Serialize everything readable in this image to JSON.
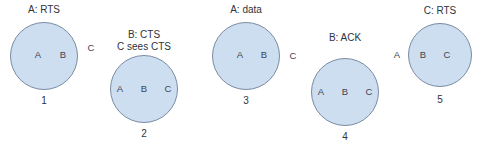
{
  "figure": {
    "background_color": "#ffffff",
    "circle_fill_color": "#cddef0",
    "circle_border_color": "#7a8ba3",
    "text_color": "#2f333c"
  },
  "panels": [
    {
      "id": "panel-1",
      "number": "1",
      "event_lines": [
        "A: RTS"
      ],
      "circle": {
        "cx": 44,
        "cy": 56,
        "r": 34
      },
      "inside_nodes": [
        {
          "label": "A",
          "x": 38,
          "y": 55
        },
        {
          "label": "B",
          "x": 63,
          "y": 55
        }
      ],
      "outside_nodes": [
        {
          "label": "C",
          "x": 91,
          "y": 48
        }
      ],
      "event_x": 44,
      "event_y": 4,
      "number_x": 44,
      "number_y": 95
    },
    {
      "id": "panel-2",
      "number": "2",
      "event_lines": [
        "B: CTS",
        "C sees CTS"
      ],
      "circle": {
        "cx": 144,
        "cy": 89,
        "r": 34
      },
      "inside_nodes": [
        {
          "label": "A",
          "x": 120,
          "y": 89
        },
        {
          "label": "B",
          "x": 144,
          "y": 89
        },
        {
          "label": "C",
          "x": 168,
          "y": 89
        }
      ],
      "outside_nodes": [],
      "event_x": 144,
      "event_y": 29,
      "number_x": 144,
      "number_y": 128
    },
    {
      "id": "panel-3",
      "number": "3",
      "event_lines": [
        "A: data"
      ],
      "circle": {
        "cx": 246,
        "cy": 56,
        "r": 34
      },
      "inside_nodes": [
        {
          "label": "A",
          "x": 240,
          "y": 55
        },
        {
          "label": "B",
          "x": 264,
          "y": 55
        }
      ],
      "outside_nodes": [
        {
          "label": "C",
          "x": 293,
          "y": 56
        }
      ],
      "event_x": 246,
      "event_y": 4,
      "number_x": 246,
      "number_y": 95
    },
    {
      "id": "panel-4",
      "number": "4",
      "event_lines": [
        "B: ACK"
      ],
      "circle": {
        "cx": 345,
        "cy": 92,
        "r": 34
      },
      "inside_nodes": [
        {
          "label": "A",
          "x": 321,
          "y": 92
        },
        {
          "label": "B",
          "x": 345,
          "y": 92
        },
        {
          "label": "C",
          "x": 369,
          "y": 92
        }
      ],
      "outside_nodes": [],
      "event_x": 345,
      "event_y": 32,
      "number_x": 345,
      "number_y": 131
    },
    {
      "id": "panel-5",
      "number": "5",
      "event_lines": [
        "C: RTS"
      ],
      "circle": {
        "cx": 440,
        "cy": 55,
        "r": 32
      },
      "inside_nodes": [
        {
          "label": "B",
          "x": 423,
          "y": 55
        },
        {
          "label": "C",
          "x": 447,
          "y": 55
        }
      ],
      "outside_nodes": [
        {
          "label": "A",
          "x": 397,
          "y": 55
        }
      ],
      "event_x": 440,
      "event_y": 5,
      "number_x": 440,
      "number_y": 94
    }
  ]
}
